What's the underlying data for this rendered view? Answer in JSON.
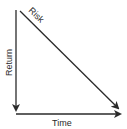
{
  "diagram": {
    "labels": {
      "risk": "Risk",
      "return": "Return",
      "time": "Time"
    },
    "colors": {
      "line": "#2a2a2a",
      "background": "#ffffff"
    }
  }
}
